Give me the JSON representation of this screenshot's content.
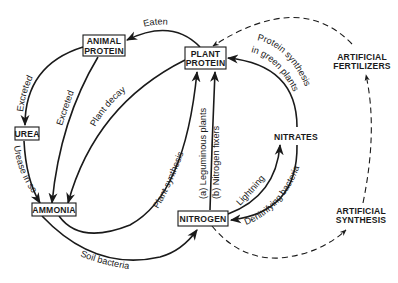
{
  "diagram": {
    "colors": {
      "ink": "#1a1a1a",
      "background": "#ffffff"
    },
    "nodes": {
      "animal_protein": {
        "line1": "ANIMAL",
        "line2": "PROTEIN"
      },
      "plant_protein": {
        "line1": "PLANT",
        "line2": "PROTEIN"
      },
      "urea": {
        "label": "UREA"
      },
      "ammonia": {
        "label": "AMMONIA"
      },
      "nitrogen": {
        "label": "NITROGEN"
      },
      "nitrates": {
        "label": "NITRATES"
      },
      "artificial_fertilizers": {
        "line1": "ARTIFICIAL",
        "line2": "FERTILIZERS"
      },
      "artificial_synthesis": {
        "line1": "ARTIFICIAL",
        "line2": "SYNTHESIS"
      }
    },
    "edges": {
      "eaten": "Eaten",
      "excreted_to_urea": "Excreted",
      "excreted_to_ammonia": "Excreted",
      "plant_decay": "Plant decay",
      "urease_in_soil": "Urease in soil",
      "plant_synthesis": "Plant synthesis",
      "soil_bacteria": "Soil bacteria",
      "leguminous_plants": "(a) Leguminous plants",
      "nitrogen_fixers": "(b) Nitrogen fixers",
      "protein_synthesis_line1": "Protein synthesis",
      "protein_synthesis_line2": "in green plants",
      "lightning": "Lightning",
      "denitrifying_bacteria": "Denitrifying bacteria"
    }
  }
}
